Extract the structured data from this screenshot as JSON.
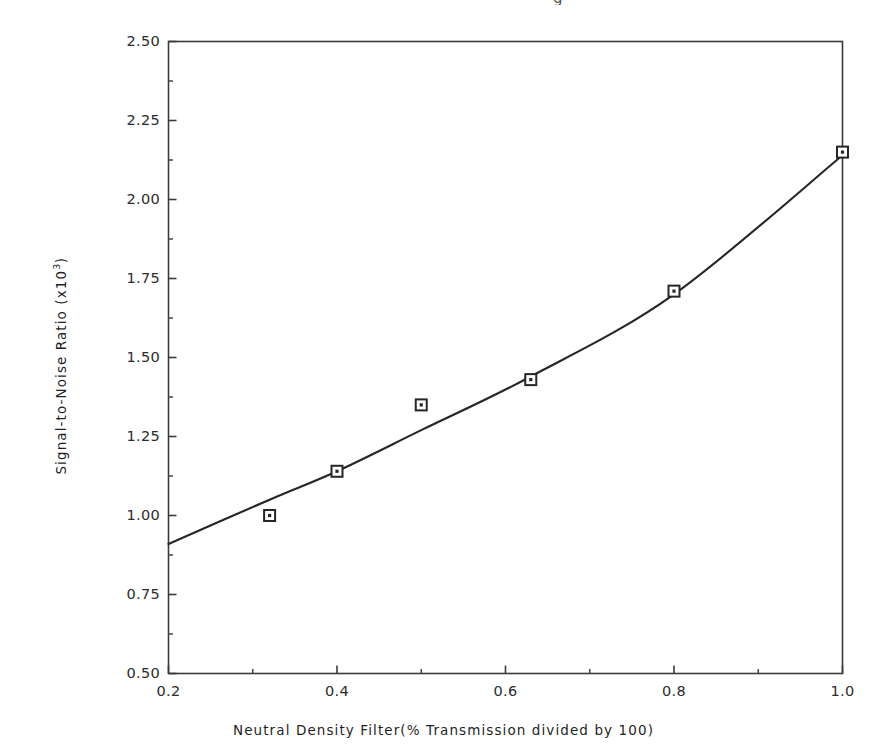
{
  "figure": {
    "top_artifact_glyph": "g",
    "background_color": "#ffffff",
    "line_color": "#262626",
    "marker_edge_color": "#262626",
    "marker_face_color": "#ffffff",
    "axis_color": "#3a3a3a"
  },
  "chart_data": {
    "type": "scatter",
    "title": "",
    "subtitle": "",
    "xlabel": "Neutral Density Filter(% Transmission divided by 100)",
    "ylabel_text": "Signal-to-Noise Ratio (x10",
    "ylabel_exponent": "3",
    "ylabel_suffix": ")",
    "ylabel_full": "Signal-to-Noise Ratio (x10^3)",
    "xlim": [
      0.2,
      1.0
    ],
    "ylim": [
      0.5,
      2.5
    ],
    "grid": false,
    "legend": "none",
    "x_ticks": [
      0.2,
      0.4,
      0.6,
      0.8,
      1.0
    ],
    "x_tick_labels": [
      "0.2",
      "0.4",
      "0.6",
      "0.8",
      "1.0"
    ],
    "x_minor_ticks": [
      0.3,
      0.5,
      0.7,
      0.9
    ],
    "y_ticks": [
      0.5,
      0.75,
      1.0,
      1.25,
      1.5,
      1.75,
      2.0,
      2.25,
      2.5
    ],
    "y_tick_labels": [
      "0.50",
      "0.75",
      "1.00",
      "1.25",
      "1.50",
      "1.75",
      "2.00",
      "2.25",
      "2.50"
    ],
    "y_minor_ticks": [
      0.625,
      0.875,
      1.125,
      1.375,
      1.625,
      1.875,
      2.125,
      2.375
    ],
    "series": [
      {
        "name": "Measured data",
        "marker": "open-square-with-dot",
        "x": [
          0.32,
          0.4,
          0.5,
          0.63,
          0.8,
          1.0
        ],
        "y": [
          1.0,
          1.14,
          1.35,
          1.43,
          1.71,
          2.15
        ]
      },
      {
        "name": "Fitted curve",
        "marker": "none",
        "style": "solid-line",
        "x": [
          0.2,
          0.32,
          0.4,
          0.5,
          0.63,
          0.8,
          1.0
        ],
        "y": [
          0.91,
          1.05,
          1.14,
          1.27,
          1.44,
          1.7,
          2.14
        ]
      }
    ]
  }
}
